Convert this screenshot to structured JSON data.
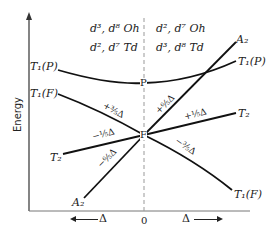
{
  "diagram": {
    "type": "orgel-energy-diagram",
    "y_axis_label": "Energy",
    "x_axis": {
      "origin_label": "0",
      "left_label": "Δ",
      "right_label": "Δ"
    },
    "header_left": {
      "line1": "d³, d⁸  Oh",
      "line2": "d², d⁷  Td"
    },
    "header_right": {
      "line1": "d², d⁷  Oh",
      "line2": "d³, d⁸  Td"
    },
    "free_ion_terms": {
      "P": "P",
      "F": "F"
    },
    "left_terms": {
      "T1P": "T₁(P)",
      "T1F": "T₁(F)",
      "T2": "T₂",
      "A2": "A₂"
    },
    "right_terms": {
      "A2": "A₂",
      "T1P": "T₁(P)",
      "T2": "T₂",
      "T1F": "T₁(F)"
    },
    "splitting_labels": {
      "left_T1F": "+⅗Δ",
      "left_T2": "−⅕Δ",
      "left_A2": "−⁶⁄₅Δ",
      "right_A2": "+⁶⁄₅Δ",
      "right_T2": "+⅕Δ",
      "right_T1F": "−⅗Δ"
    },
    "colors": {
      "line": "#111111",
      "dashed": "#999999",
      "text": "#222222"
    }
  }
}
